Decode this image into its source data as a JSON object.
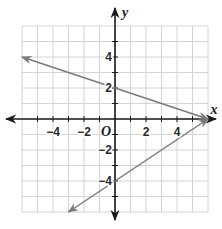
{
  "chart_data": {
    "type": "line",
    "title": "",
    "xlabel": "x",
    "ylabel": "y",
    "origin_label": "O",
    "xlim": [
      -6,
      6
    ],
    "ylim": [
      -6,
      6
    ],
    "grid": true,
    "x_tick_labels": [
      "-4",
      "-2",
      "2",
      "4"
    ],
    "y_tick_labels": [
      "4",
      "2",
      "-2",
      "-4"
    ],
    "x_ticks": [
      -4,
      -2,
      2,
      4
    ],
    "y_ticks": [
      4,
      2,
      -2,
      -4
    ],
    "series": [
      {
        "name": "upper line",
        "equation": "y = -x/3 + 2",
        "points": [
          [
            -6,
            4
          ],
          [
            0,
            2
          ],
          [
            6,
            0
          ]
        ],
        "arrow_ends": [
          [
            -6,
            4
          ],
          [
            6,
            0
          ]
        ]
      },
      {
        "name": "lower line",
        "equation": "y = 2x/3 - 4",
        "points": [
          [
            -3,
            -6
          ],
          [
            0,
            -4
          ],
          [
            6,
            0
          ]
        ],
        "arrow_ends": [
          [
            -3,
            -6
          ],
          [
            6,
            0
          ]
        ]
      }
    ],
    "intersection": [
      6,
      0
    ],
    "colors": {
      "grid": "#d4d4d4",
      "axes": "#1a1a1a",
      "lines": "#7a7a7a"
    }
  }
}
